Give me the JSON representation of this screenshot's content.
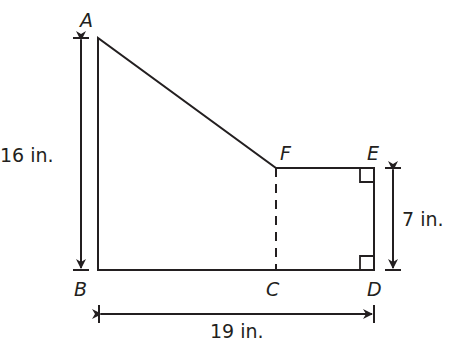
{
  "figure": {
    "type": "composite-figure",
    "vertices": {
      "A": "A",
      "B": "B",
      "C": "C",
      "D": "D",
      "E": "E",
      "F": "F"
    },
    "dimensions": {
      "height_AB": "16 in.",
      "base_BD": "19 in.",
      "height_DE": "7 in."
    },
    "colors": {
      "stroke": "#231f20",
      "background": "#ffffff"
    }
  }
}
